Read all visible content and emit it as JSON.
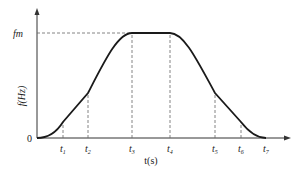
{
  "diagram": {
    "type": "velocity_profile",
    "y_axis": {
      "label": "f(Hz)",
      "top_label": "fm",
      "origin_label": "0"
    },
    "x_axis": {
      "label": "t(s)"
    },
    "ticks": [
      {
        "id": "t1",
        "main": "t",
        "sub": "1",
        "x": 63
      },
      {
        "id": "t2",
        "main": "t",
        "sub": "2",
        "x": 88
      },
      {
        "id": "t3",
        "main": "t",
        "sub": "3",
        "x": 132
      },
      {
        "id": "t4",
        "main": "t",
        "sub": "4",
        "x": 170
      },
      {
        "id": "t5",
        "main": "t",
        "sub": "5",
        "x": 215
      },
      {
        "id": "t6",
        "main": "t",
        "sub": "6",
        "x": 241
      },
      {
        "id": "t7",
        "main": "t",
        "sub": "7",
        "x": 266
      }
    ],
    "colors": {
      "curve": "#1a1a1a",
      "axis": "#333333",
      "dashed": "#666666"
    }
  }
}
